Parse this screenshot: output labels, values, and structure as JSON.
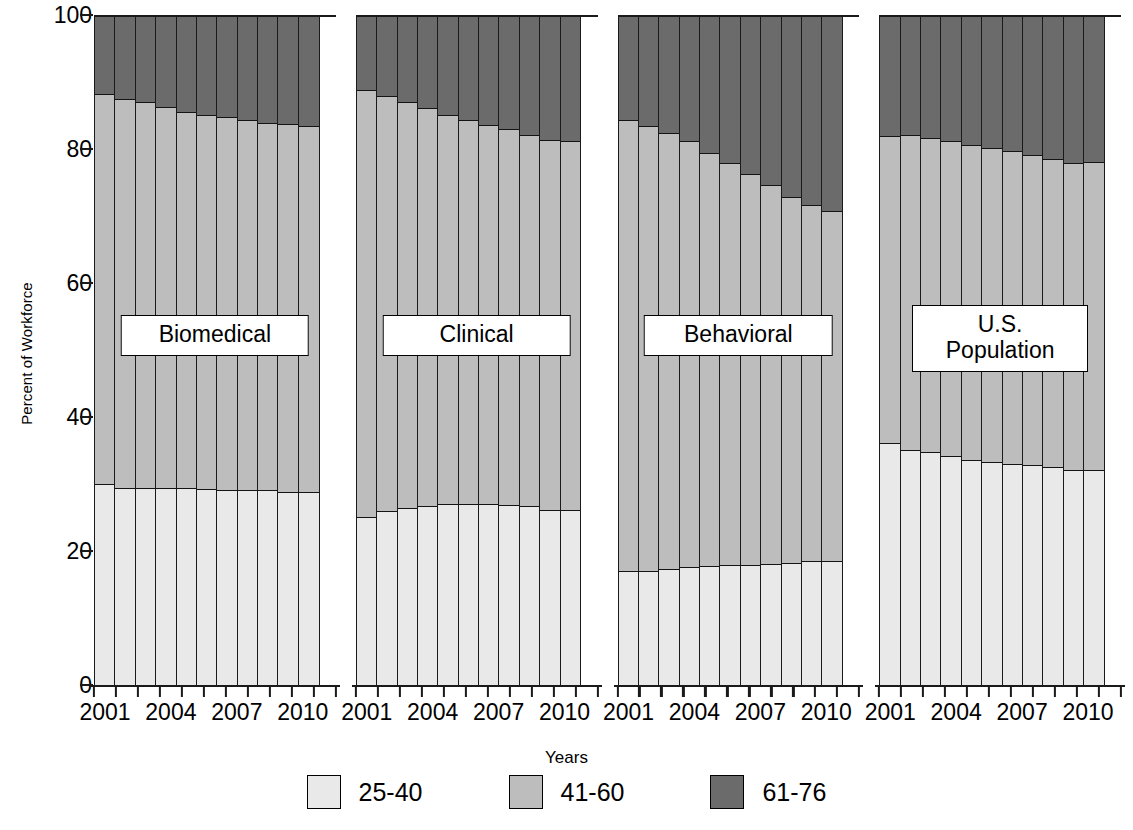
{
  "chart_data": {
    "type": "bar",
    "subtype": "stacked-percent",
    "title": "",
    "xlabel": "Years",
    "ylabel": "Percent of Workforce",
    "ylim": [
      0,
      100
    ],
    "yticks": [
      0,
      20,
      40,
      60,
      80,
      100
    ],
    "grid": false,
    "legend_position": "bottom",
    "stack_order_bottom_to_top": [
      "25-40",
      "41-60",
      "61-76"
    ],
    "series_colors": {
      "25-40": "#e9e9e9",
      "41-60": "#bdbdbd",
      "61-76": "#6b6b6b"
    },
    "legend": [
      {
        "label": "25-40",
        "color": "#e9e9e9"
      },
      {
        "label": "41-60",
        "color": "#bdbdbd"
      },
      {
        "label": "61-76",
        "color": "#6b6b6b"
      }
    ],
    "panels": [
      {
        "name": "Biomedical",
        "x": [
          2001,
          2002,
          2003,
          2004,
          2005,
          2006,
          2007,
          2008,
          2009,
          2010,
          2011
        ],
        "xtick_labels": [
          "2001",
          "",
          "",
          "2004",
          "",
          "",
          "2007",
          "",
          "",
          "2010",
          ""
        ],
        "series": [
          {
            "name": "25-40",
            "values": [
              29.8,
              29.2,
              29.2,
              29.2,
              29.2,
              29.1,
              29.0,
              29.0,
              28.9,
              28.7,
              28.7
            ]
          },
          {
            "name": "41-60",
            "values": [
              58.3,
              58.1,
              57.6,
              56.9,
              56.2,
              55.8,
              55.6,
              55.2,
              54.9,
              54.9,
              54.6
            ]
          },
          {
            "name": "61-76",
            "values": [
              11.9,
              12.7,
              13.2,
              13.9,
              14.6,
              15.1,
              15.4,
              15.8,
              16.2,
              16.4,
              16.7
            ]
          }
        ],
        "cumulative_tops": {
          "25-40": [
            29.8,
            29.2,
            29.2,
            29.2,
            29.2,
            29.1,
            29.0,
            29.0,
            28.9,
            28.7,
            28.7
          ],
          "41-60": [
            88.1,
            87.3,
            86.8,
            86.1,
            85.4,
            84.9,
            84.6,
            84.2,
            83.8,
            83.6,
            83.3
          ]
        }
      },
      {
        "name": "Clinical",
        "x": [
          2001,
          2002,
          2003,
          2004,
          2005,
          2006,
          2007,
          2008,
          2009,
          2010,
          2011
        ],
        "xtick_labels": [
          "2001",
          "",
          "",
          "2004",
          "",
          "",
          "2007",
          "",
          "",
          "2010",
          ""
        ],
        "series": [
          {
            "name": "25-40",
            "values": [
              24.9,
              25.8,
              26.2,
              26.5,
              26.8,
              26.9,
              26.9,
              26.7,
              26.5,
              26.0,
              25.9
            ]
          },
          {
            "name": "41-60",
            "values": [
              63.7,
              62.0,
              60.6,
              59.4,
              58.2,
              57.3,
              56.6,
              56.1,
              55.5,
              55.2,
              55.2
            ]
          },
          {
            "name": "61-76",
            "values": [
              11.4,
              12.2,
              13.2,
              14.1,
              15.0,
              15.8,
              16.5,
              17.2,
              18.0,
              18.8,
              18.9
            ]
          }
        ],
        "cumulative_tops": {
          "25-40": [
            24.9,
            25.8,
            26.2,
            26.5,
            26.8,
            26.9,
            26.9,
            26.7,
            26.5,
            26.0,
            25.9
          ],
          "41-60": [
            88.6,
            87.8,
            86.8,
            85.9,
            85.0,
            84.2,
            83.5,
            82.8,
            82.0,
            81.2,
            81.1
          ]
        }
      },
      {
        "name": "Behavioral",
        "x": [
          2001,
          2002,
          2003,
          2004,
          2005,
          2006,
          2007,
          2008,
          2009,
          2010,
          2011
        ],
        "xtick_labels": [
          "2001",
          "",
          "",
          "2004",
          "",
          "",
          "2007",
          "",
          "",
          "2010",
          ""
        ],
        "series": [
          {
            "name": "25-40",
            "values": [
              16.8,
              16.9,
              17.1,
              17.4,
              17.6,
              17.7,
              17.8,
              17.9,
              18.1,
              18.3,
              18.4
            ]
          },
          {
            "name": "41-60",
            "values": [
              67.4,
              66.4,
              65.2,
              63.6,
              61.7,
              60.0,
              58.3,
              56.6,
              54.6,
              53.2,
              52.2
            ]
          },
          {
            "name": "61-76",
            "values": [
              15.8,
              16.7,
              17.7,
              19.0,
              20.7,
              22.3,
              23.9,
              25.5,
              27.3,
              28.5,
              29.4
            ]
          }
        ],
        "cumulative_tops": {
          "25-40": [
            16.8,
            16.9,
            17.1,
            17.4,
            17.6,
            17.7,
            17.8,
            17.9,
            18.1,
            18.3,
            18.4
          ],
          "41-60": [
            84.2,
            83.3,
            82.3,
            81.0,
            79.3,
            77.7,
            76.1,
            74.5,
            72.7,
            71.5,
            70.6
          ]
        }
      },
      {
        "name": "U.S.\nPopulation",
        "x": [
          2001,
          2002,
          2003,
          2004,
          2005,
          2006,
          2007,
          2008,
          2009,
          2010,
          2011
        ],
        "xtick_labels": [
          "2001",
          "",
          "",
          "2004",
          "",
          "",
          "2007",
          "",
          "",
          "2010",
          ""
        ],
        "series": [
          {
            "name": "25-40",
            "values": [
              36.0,
              35.0,
              34.6,
              34.0,
              33.5,
              33.2,
              32.9,
              32.7,
              32.4,
              32.0,
              31.9
            ]
          },
          {
            "name": "41-60",
            "values": [
              45.8,
              46.9,
              46.9,
              47.0,
              46.9,
              46.8,
              46.6,
              46.3,
              46.0,
              45.8,
              46.0
            ]
          },
          {
            "name": "61-76",
            "values": [
              18.2,
              18.1,
              18.5,
              19.0,
              19.6,
              20.0,
              20.5,
              21.0,
              21.6,
              22.2,
              22.1
            ]
          }
        ],
        "cumulative_tops": {
          "25-40": [
            36.0,
            35.0,
            34.6,
            34.0,
            33.5,
            33.2,
            32.9,
            32.7,
            32.4,
            32.0,
            31.9
          ],
          "41-60": [
            81.8,
            81.9,
            81.5,
            81.0,
            80.4,
            80.0,
            79.5,
            79.0,
            78.4,
            77.8,
            77.9
          ]
        }
      }
    ]
  }
}
